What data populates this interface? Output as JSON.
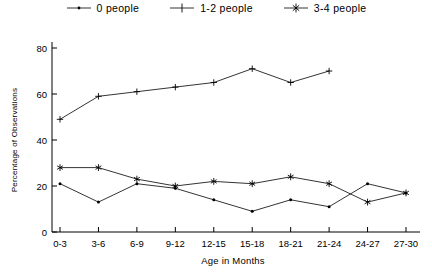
{
  "chart_data": {
    "type": "line",
    "title": "",
    "xlabel": "Age in Months",
    "ylabel": "Percentage of Observations",
    "categories": [
      "0-3",
      "3-6",
      "6-9",
      "9-12",
      "12-15",
      "15-18",
      "18-21",
      "21-24",
      "24-27",
      "27-30"
    ],
    "ylim": [
      0,
      80
    ],
    "yticks": [
      0,
      20,
      40,
      60,
      80
    ],
    "ytick_labels": [
      "0",
      "20",
      "40",
      "60",
      "80"
    ],
    "grid": false,
    "legend_position": "top-center",
    "series": [
      {
        "name": "0 people",
        "marker": "dot",
        "values": [
          21,
          13,
          21,
          19,
          14,
          9,
          14,
          11,
          21,
          17
        ]
      },
      {
        "name": "1-2 people",
        "marker": "plus",
        "values": [
          49,
          59,
          61,
          63,
          65,
          71,
          65,
          70,
          null,
          null
        ]
      },
      {
        "name": "3-4 people",
        "marker": "asterisk",
        "values": [
          28,
          28,
          23,
          20,
          22,
          21,
          24,
          21,
          13,
          17
        ]
      }
    ]
  },
  "legend": {
    "items": [
      {
        "label": "0 people",
        "marker": "dot"
      },
      {
        "label": "1-2 people",
        "marker": "plus"
      },
      {
        "label": "3-4 people",
        "marker": "asterisk"
      }
    ]
  },
  "axes": {
    "x_title": "Age in Months",
    "y_title": "Percentage of Observations"
  },
  "colors": {
    "ink": "#000000",
    "background": "#ffffff"
  }
}
